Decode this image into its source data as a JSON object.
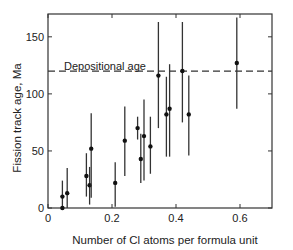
{
  "chart_data": {
    "type": "scatter",
    "title": "",
    "xlabel": "Number of Cl atoms per formula unit",
    "ylabel": "Fission track age, Ma",
    "xlim": [
      0,
      0.7
    ],
    "ylim": [
      0,
      170
    ],
    "x_ticks": [
      0,
      0.2,
      0.4,
      0.6
    ],
    "x_tick_labels": [
      "0",
      "0.2",
      "0.4",
      "0.6"
    ],
    "y_ticks": [
      0,
      50,
      100,
      150
    ],
    "y_tick_labels": [
      "0",
      "50",
      "100",
      "150"
    ],
    "grid": false,
    "legend": null,
    "reference_line": {
      "y": 120,
      "style": "dashed",
      "label": "Depositional age"
    },
    "series": [
      {
        "name": "Fission track ages with error bars",
        "points": [
          {
            "x": 0.045,
            "y": 10,
            "y_low": 0,
            "y_high": 24
          },
          {
            "x": 0.045,
            "y": 0,
            "y_low": 0,
            "y_high": 0
          },
          {
            "x": 0.06,
            "y": 13,
            "y_low": 0,
            "y_high": 35
          },
          {
            "x": 0.12,
            "y": 28,
            "y_low": 10,
            "y_high": 48
          },
          {
            "x": 0.13,
            "y": 20,
            "y_low": 3,
            "y_high": 36
          },
          {
            "x": 0.135,
            "y": 52,
            "y_low": 9,
            "y_high": 83
          },
          {
            "x": 0.21,
            "y": 22,
            "y_low": 1,
            "y_high": 40
          },
          {
            "x": 0.24,
            "y": 59,
            "y_low": 28,
            "y_high": 89
          },
          {
            "x": 0.28,
            "y": 70,
            "y_low": 60,
            "y_high": 80
          },
          {
            "x": 0.29,
            "y": 43,
            "y_low": 22,
            "y_high": 65
          },
          {
            "x": 0.3,
            "y": 63,
            "y_low": 24,
            "y_high": 95
          },
          {
            "x": 0.32,
            "y": 54,
            "y_low": 30,
            "y_high": 80
          },
          {
            "x": 0.345,
            "y": 116,
            "y_low": 70,
            "y_high": 163
          },
          {
            "x": 0.37,
            "y": 82,
            "y_low": 45,
            "y_high": 115
          },
          {
            "x": 0.38,
            "y": 87,
            "y_low": 45,
            "y_high": 126
          },
          {
            "x": 0.42,
            "y": 120,
            "y_low": 75,
            "y_high": 163
          },
          {
            "x": 0.44,
            "y": 82,
            "y_low": 46,
            "y_high": 116
          },
          {
            "x": 0.59,
            "y": 127,
            "y_low": 87,
            "y_high": 167
          }
        ]
      }
    ]
  },
  "plot": {
    "ylabel": "Fission track age, Ma",
    "xlabel": "Number of Cl atoms per formula unit",
    "annotation": "Depositional age",
    "colors": {
      "axis": "#333333",
      "point": "#111111",
      "errorbar": "#333333",
      "dash": "#333333"
    }
  }
}
